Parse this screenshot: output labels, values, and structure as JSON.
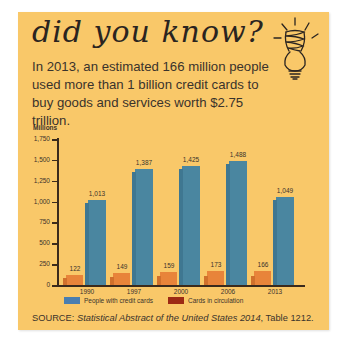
{
  "heading": "did you know?",
  "blurb": "In 2013, an estimated 166 million people used more than 1 billion credit cards to buy goods and services worth $2.75 trillion.",
  "icons": {
    "top_right": "lightbulb-icon"
  },
  "colors": {
    "background": "#f9c869",
    "blue_series": "#4a86a0",
    "orange_series": "#e8843a",
    "legend_red": "#9c2a14",
    "axis": "#3a2a1c"
  },
  "source": {
    "prefix": "SOURCE: ",
    "title": "Statistical Abstract of the United States 2014",
    "suffix": ", Table 1212."
  },
  "chart_data": {
    "type": "bar",
    "title": "",
    "ylabel": "Millions",
    "xlabel": "",
    "ylim": [
      0,
      1750
    ],
    "yticks": [
      "0",
      "250",
      "500",
      "750",
      "1,000",
      "1,250",
      "1,500",
      "1,750"
    ],
    "categories": [
      "1990",
      "1997",
      "2000",
      "2006",
      "2013"
    ],
    "series": [
      {
        "name": "Cards in circulation",
        "values": [
          122,
          149,
          159,
          173,
          166
        ],
        "labels": [
          "122",
          "149",
          "159",
          "173",
          "166"
        ]
      },
      {
        "name": "People with credit cards",
        "values": [
          1013,
          1387,
          1425,
          1488,
          1049
        ],
        "labels": [
          "1,013",
          "1,387",
          "1,425",
          "1,488",
          "1,049"
        ]
      }
    ],
    "legend": [
      {
        "label": "People with credit cards",
        "color": "#4a7eb0"
      },
      {
        "label": "Cards in circulation",
        "color": "#9c2a14"
      }
    ],
    "legend_position": "bottom",
    "grid": false
  }
}
